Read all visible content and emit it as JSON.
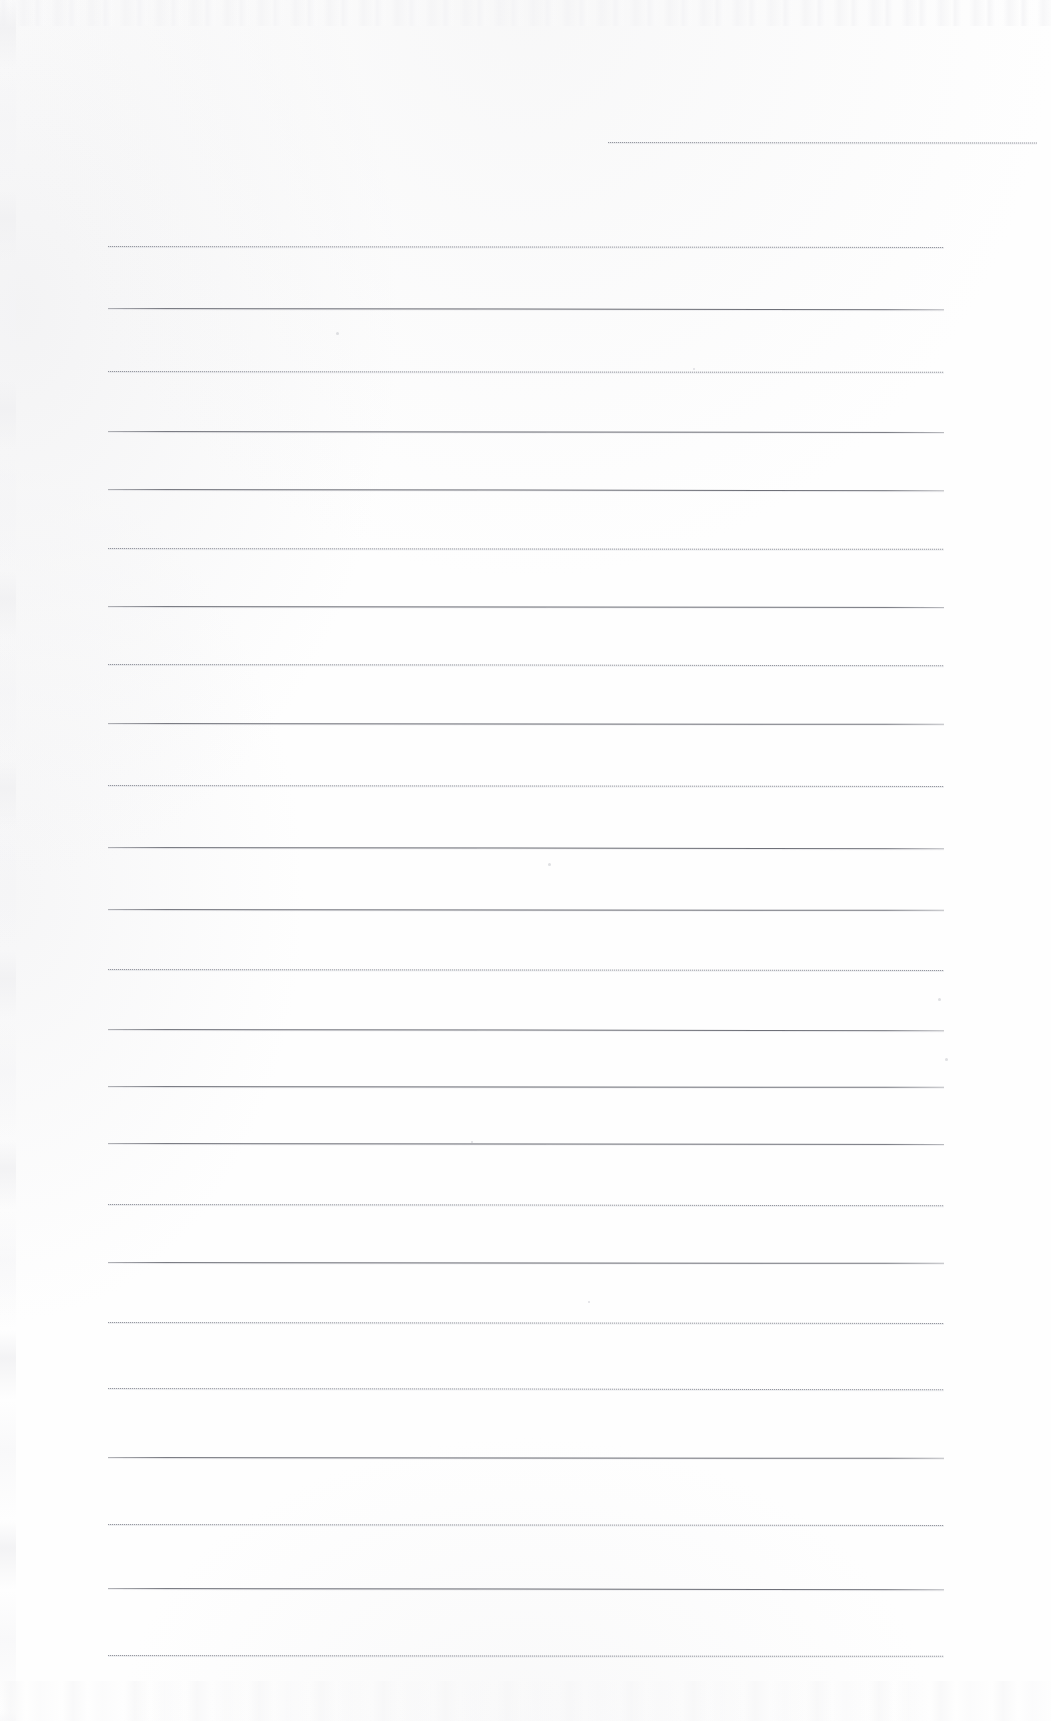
{
  "document": {
    "kind": "scanned-blank-ruled-page",
    "page_title": "Scanned Blank Ruled Page",
    "orientation": "portrait",
    "width_px": 1051,
    "height_px": 1721,
    "background_color": "#fefefe",
    "text_content": "",
    "has_visible_text": false,
    "notes_label": ""
  },
  "ruling": {
    "line_count": 24,
    "default_left_px": 108,
    "default_right_px": 944,
    "rule_color_solid": "#5c5e67",
    "rule_color_dotted": "#787a84",
    "style_alternation": "dotted,solid",
    "average_spacing_px": 64.5,
    "lines": [
      {
        "y": 142,
        "left": 608,
        "right": 1037,
        "style": "dotted"
      },
      {
        "y": 246,
        "left": 108,
        "right": 944,
        "style": "dotted"
      },
      {
        "y": 308,
        "left": 108,
        "right": 944,
        "style": "solid"
      },
      {
        "y": 371,
        "left": 108,
        "right": 944,
        "style": "dotted"
      },
      {
        "y": 431,
        "left": 108,
        "right": 944,
        "style": "solid"
      },
      {
        "y": 489,
        "left": 108,
        "right": 944,
        "style": "solid"
      },
      {
        "y": 548,
        "left": 108,
        "right": 944,
        "style": "dotted"
      },
      {
        "y": 606,
        "left": 108,
        "right": 944,
        "style": "solid"
      },
      {
        "y": 664,
        "left": 108,
        "right": 944,
        "style": "dotted"
      },
      {
        "y": 723,
        "left": 108,
        "right": 944,
        "style": "solid"
      },
      {
        "y": 785,
        "left": 108,
        "right": 944,
        "style": "dotted"
      },
      {
        "y": 847,
        "left": 108,
        "right": 944,
        "style": "solid"
      },
      {
        "y": 909,
        "left": 108,
        "right": 944,
        "style": "solid"
      },
      {
        "y": 969,
        "left": 108,
        "right": 944,
        "style": "dotted"
      },
      {
        "y": 1029,
        "left": 108,
        "right": 944,
        "style": "solid"
      },
      {
        "y": 1086,
        "left": 108,
        "right": 944,
        "style": "solid"
      },
      {
        "y": 1143,
        "left": 108,
        "right": 944,
        "style": "solid"
      },
      {
        "y": 1204,
        "left": 108,
        "right": 944,
        "style": "dotted"
      },
      {
        "y": 1262,
        "left": 108,
        "right": 944,
        "style": "solid"
      },
      {
        "y": 1322,
        "left": 108,
        "right": 944,
        "style": "dotted"
      },
      {
        "y": 1388,
        "left": 108,
        "right": 944,
        "style": "dotted"
      },
      {
        "y": 1457,
        "left": 108,
        "right": 944,
        "style": "solid"
      },
      {
        "y": 1524,
        "left": 108,
        "right": 944,
        "style": "dotted"
      },
      {
        "y": 1588,
        "left": 108,
        "right": 944,
        "style": "solid"
      },
      {
        "y": 1655,
        "left": 108,
        "right": 944,
        "style": "dotted"
      }
    ]
  },
  "artifacts": {
    "specks": [
      {
        "x": 336,
        "y": 332,
        "size": 3
      },
      {
        "x": 548,
        "y": 863,
        "size": 3
      },
      {
        "x": 938,
        "y": 998,
        "size": 3
      },
      {
        "x": 945,
        "y": 1058,
        "size": 3
      },
      {
        "x": 471,
        "y": 1141,
        "size": 2
      },
      {
        "x": 588,
        "y": 1301,
        "size": 2
      },
      {
        "x": 693,
        "y": 368,
        "size": 2
      }
    ]
  }
}
